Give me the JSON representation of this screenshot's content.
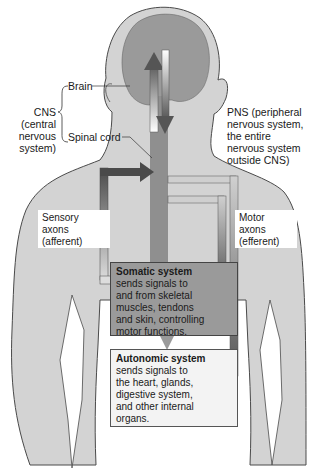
{
  "colors": {
    "skin": "#d3d3d3",
    "skin_outline": "#4a4a4a",
    "brain": "#9a9a9a",
    "spinal_cord": "#8f8f8f",
    "arrow_dark": "#5a5a5a",
    "arrow_light": "#c8c8c8",
    "somatic_fill": "#9a9a9a",
    "autonomic_fill": "#f3f3f3"
  },
  "labels": {
    "brain": "Brain",
    "spinal_cord": "Spinal cord",
    "cns": [
      "CNS",
      "(central",
      "nervous",
      "system)"
    ],
    "pns": [
      "PNS (peripheral",
      "nervous system,",
      "the entire",
      "nervous system",
      "outside CNS)"
    ]
  },
  "boxes": {
    "sensory": [
      "Sensory",
      "axons",
      "(afferent)"
    ],
    "motor": [
      "Motor",
      "axons",
      "(efferent)"
    ],
    "somatic": {
      "title": "Somatic system",
      "lines": [
        "sends signals to",
        "and from skeletal",
        "muscles, tendons",
        "and skin, controlling",
        "motor functions."
      ]
    },
    "autonomic": {
      "title": "Autonomic system",
      "lines": [
        "sends signals to",
        "the heart, glands,",
        "digestive system,",
        "and other internal",
        "organs."
      ]
    }
  }
}
